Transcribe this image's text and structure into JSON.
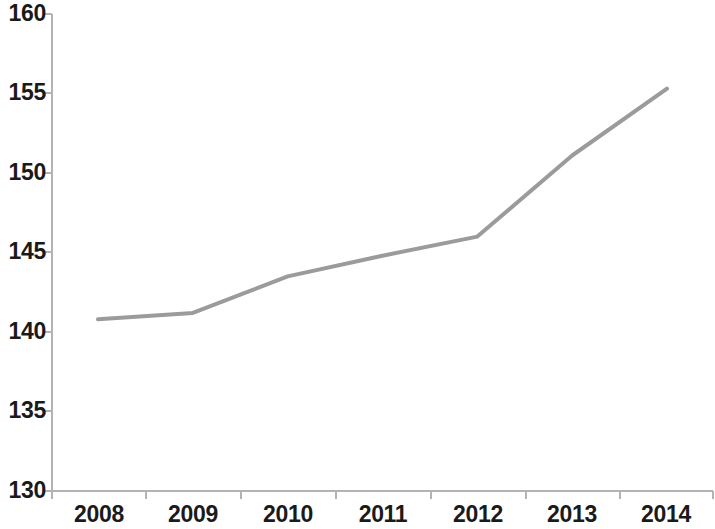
{
  "chart_data": {
    "type": "line",
    "title": "",
    "subtitle": "",
    "xlabel": "",
    "ylabel": "",
    "categories": [
      "2008",
      "2009",
      "2010",
      "2011",
      "2012",
      "2013",
      "2014"
    ],
    "x": [
      2008,
      2009,
      2010,
      2011,
      2012,
      2013,
      2014
    ],
    "series": [
      {
        "name": "",
        "color": "#9b9b9b",
        "values": [
          140.8,
          141.2,
          143.5,
          144.8,
          146.0,
          151.1,
          155.3
        ]
      }
    ],
    "values": [
      140.8,
      141.2,
      143.5,
      144.8,
      146.0,
      151.1,
      155.3
    ],
    "ylim": [
      130,
      160
    ],
    "ytick_step": 5,
    "yticks": [
      130,
      135,
      140,
      145,
      150,
      155,
      160
    ],
    "ytick_labels": [
      "130",
      "135",
      "140",
      "145",
      "150",
      "155",
      "160"
    ],
    "xtick_labels": [
      "2008",
      "2009",
      "2010",
      "2011",
      "2012",
      "2013",
      "2014"
    ],
    "grid": false,
    "legend": "none",
    "markers": false,
    "line_width": 4,
    "axis_color": "#b0b0b0",
    "tick_label_color": "#1a1a1a",
    "background": "#ffffff"
  },
  "axes": {
    "y_axis_name": "value-axis",
    "x_axis_name": "year-axis"
  }
}
